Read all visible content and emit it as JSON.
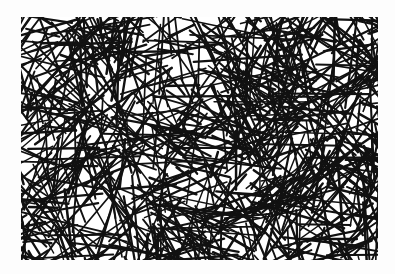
{
  "image": {
    "description": "Random fiber network of black straight line segments on white background",
    "background": "#ffffff",
    "line_color": "#111111",
    "region": {
      "x": 21,
      "y": 17,
      "width": 357,
      "height": 243
    },
    "network": {
      "line_count": 900,
      "stroke_width": 2,
      "min_length": 25,
      "max_length": 110,
      "seed": 7
    }
  }
}
